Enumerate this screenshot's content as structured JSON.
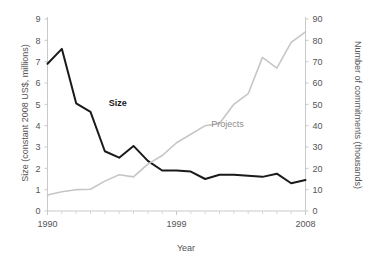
{
  "chart_data": {
    "type": "line",
    "title": "",
    "subtitle": "",
    "xlabel": "Year",
    "ylabel": "Size (constant 2008 US$, millions)",
    "y2label": "Number of commitments (thousands)",
    "x": [
      1990,
      1991,
      1992,
      1993,
      1994,
      1995,
      1996,
      1997,
      1998,
      1999,
      2000,
      2001,
      2002,
      2003,
      2004,
      2005,
      2006,
      2007,
      2008
    ],
    "xlim": [
      1990,
      2008
    ],
    "xticks": [
      1990,
      1999,
      2008
    ],
    "xticklabels": [
      "1990",
      "1999",
      "2008"
    ],
    "xminorticks": [
      1991,
      1992,
      1993,
      1994,
      1995,
      1996,
      1997,
      1998,
      2000,
      2001,
      2002,
      2003,
      2004,
      2005,
      2006,
      2007
    ],
    "ylim": [
      0,
      9
    ],
    "yticks": [
      0,
      1,
      2,
      3,
      4,
      5,
      6,
      7,
      8,
      9
    ],
    "yticklabels": [
      "0",
      "1",
      "2",
      "3",
      "4",
      "5",
      "6",
      "7",
      "8",
      "9"
    ],
    "y2lim": [
      0,
      90
    ],
    "y2ticks": [
      0,
      10,
      20,
      30,
      40,
      50,
      60,
      70,
      80,
      90
    ],
    "y2ticklabels": [
      "0",
      "10",
      "20",
      "30",
      "40",
      "50",
      "60",
      "70",
      "80",
      "90"
    ],
    "grid": false,
    "legend_position": "inline-annotations",
    "series": [
      {
        "name": "Size",
        "axis": "left",
        "color": "#1a1a1a",
        "linewidth": 2.0,
        "label_x": 1994,
        "label_y": 5.0,
        "values": [
          6.9,
          7.6,
          5.05,
          4.65,
          2.8,
          2.5,
          3.05,
          2.35,
          1.9,
          1.9,
          1.85,
          1.5,
          1.7,
          1.7,
          1.65,
          1.6,
          1.75,
          1.3,
          1.45
        ]
      },
      {
        "name": "Projects",
        "axis": "right",
        "color": "#c6c6c6",
        "linewidth": 1.6,
        "label_x": 2001,
        "label_y": 41,
        "values": [
          7.5,
          9.0,
          10.0,
          10.2,
          14.0,
          17.0,
          16.0,
          22.0,
          26.0,
          32.0,
          36.0,
          40.0,
          41.0,
          50.0,
          55.0,
          72.0,
          67.0,
          79.0,
          84.0
        ]
      }
    ]
  },
  "annotations": {
    "size_label": "Size",
    "projects_label": "Projects"
  },
  "axes": {
    "x_title": "Year",
    "y_left_title": "Size (constant 2008 US$, millions)",
    "y_right_title": "Number of commitments (thousands)"
  }
}
